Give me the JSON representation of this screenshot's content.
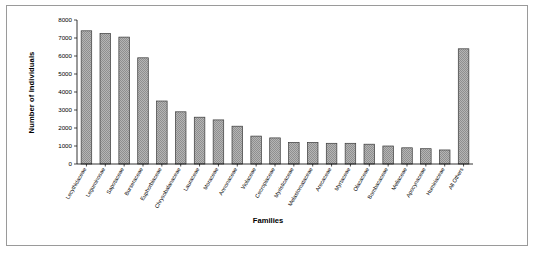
{
  "figure": {
    "xlabel": "Families",
    "ylabel": "Number of Individuals"
  },
  "axis": {
    "y_ticks": [
      "0",
      "1000",
      "2000",
      "3000",
      "4000",
      "5000",
      "6000",
      "7000",
      "8000"
    ]
  },
  "style": {
    "bar_fill": "#8a8a8a",
    "bar_edge": "#3a3a3a",
    "axis_color": "#000000",
    "frame_color": "#9a9a9a",
    "background": "#ffffff"
  },
  "chart_data": {
    "type": "bar",
    "title": "",
    "xlabel": "Families",
    "ylabel": "Number of Individuals",
    "ylim": [
      0,
      8000
    ],
    "ytick_step": 1000,
    "grid": false,
    "legend": false,
    "categories": [
      "Lecythidaceae",
      "Leguminosae",
      "Sapotaceae",
      "Burseraceae",
      "Euphorbiaceae",
      "Chrysobalanaceae",
      "Lauraceae",
      "Moraceae",
      "Annonaceae",
      "Violaceae",
      "Cecropiaceae",
      "Myristicaceae",
      "Melastomataceae",
      "Arecaceae",
      "Myrtaceae",
      "Olacaceae",
      "Bombacaceae",
      "Meliaceae",
      "Apocynaceae",
      "Humiriaceae",
      "All Others"
    ],
    "values": [
      7400,
      7250,
      7050,
      5900,
      3500,
      2900,
      2600,
      2450,
      2100,
      1550,
      1450,
      1200,
      1200,
      1150,
      1150,
      1100,
      1000,
      900,
      850,
      780,
      6400
    ]
  }
}
